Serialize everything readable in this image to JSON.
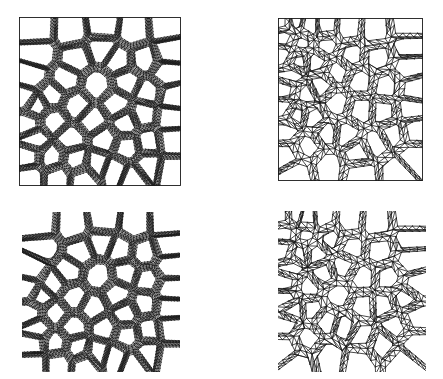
{
  "figure": {
    "title": "",
    "background_color": "#ffffff",
    "line_color": "#1a1a1a",
    "layout": "2x2 grid of mesh panels",
    "panel_count": 4
  },
  "panels": [
    {
      "id": "top-left",
      "name": "fine-mesh-boxed",
      "label": "",
      "mesh_type": "fine",
      "bounded": true,
      "border": "square frame",
      "x": 19,
      "y": 17,
      "width": 162,
      "height": 169,
      "description": "Fine triangular mesh of porous microstructure inside square domain",
      "seed": 11,
      "cells": 46,
      "refine": 3
    },
    {
      "id": "top-right",
      "name": "coarse-mesh-boxed",
      "label": "",
      "mesh_type": "coarse",
      "bounded": true,
      "border": "square frame",
      "x": 278,
      "y": 18,
      "width": 145,
      "height": 163,
      "description": "Coarse triangular mesh of porous microstructure inside square domain",
      "seed": 11,
      "cells": 46,
      "refine": 0
    },
    {
      "id": "bottom-left",
      "name": "fine-mesh-unboxed",
      "label": "",
      "mesh_type": "fine",
      "bounded": false,
      "border": "none",
      "x": 22,
      "y": 212,
      "width": 158,
      "height": 160,
      "description": "Fine triangular mesh of porous microstructure with ragged ligament boundary tabs",
      "seed": 11,
      "cells": 46,
      "refine": 3
    },
    {
      "id": "bottom-right",
      "name": "coarse-mesh-unboxed",
      "label": "",
      "mesh_type": "coarse",
      "bounded": false,
      "border": "none",
      "x": 278,
      "y": 211,
      "width": 148,
      "height": 161,
      "description": "Coarse triangular mesh of porous microstructure with ragged ligament boundary tabs",
      "seed": 11,
      "cells": 46,
      "refine": 0
    }
  ],
  "chart_data": {
    "type": "diagram",
    "subtype": "finite-element-mesh-grid",
    "title": "",
    "xlabel": "",
    "ylabel": "",
    "legend": [],
    "annotations": [],
    "grid": false,
    "rows": [
      "boxed-domain",
      "free-boundary"
    ],
    "columns": [
      "fine-mesh",
      "coarse-mesh"
    ]
  }
}
